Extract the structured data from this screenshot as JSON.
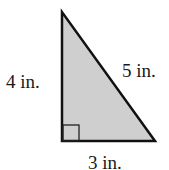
{
  "diagram": {
    "type": "right-triangle",
    "fill_color": "#cfcfcf",
    "stroke_color": "#111111",
    "labels": {
      "left_side": "4 in.",
      "hypotenuse": "5 in.",
      "bottom_side": "3 in."
    }
  }
}
